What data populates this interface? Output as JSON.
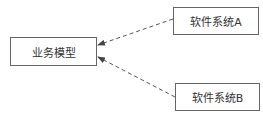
{
  "diagram": {
    "nodes": [
      {
        "id": "model",
        "label": "业务模型"
      },
      {
        "id": "a",
        "label": "软件系统A"
      },
      {
        "id": "b",
        "label": "软件系统B"
      }
    ],
    "edges": [
      {
        "from": "a",
        "to": "model",
        "style": "dashed",
        "arrow": "filled"
      },
      {
        "from": "b",
        "to": "model",
        "style": "dashed",
        "arrow": "filled"
      }
    ],
    "colors": {
      "stroke": "#555555",
      "text": "#333333"
    }
  }
}
